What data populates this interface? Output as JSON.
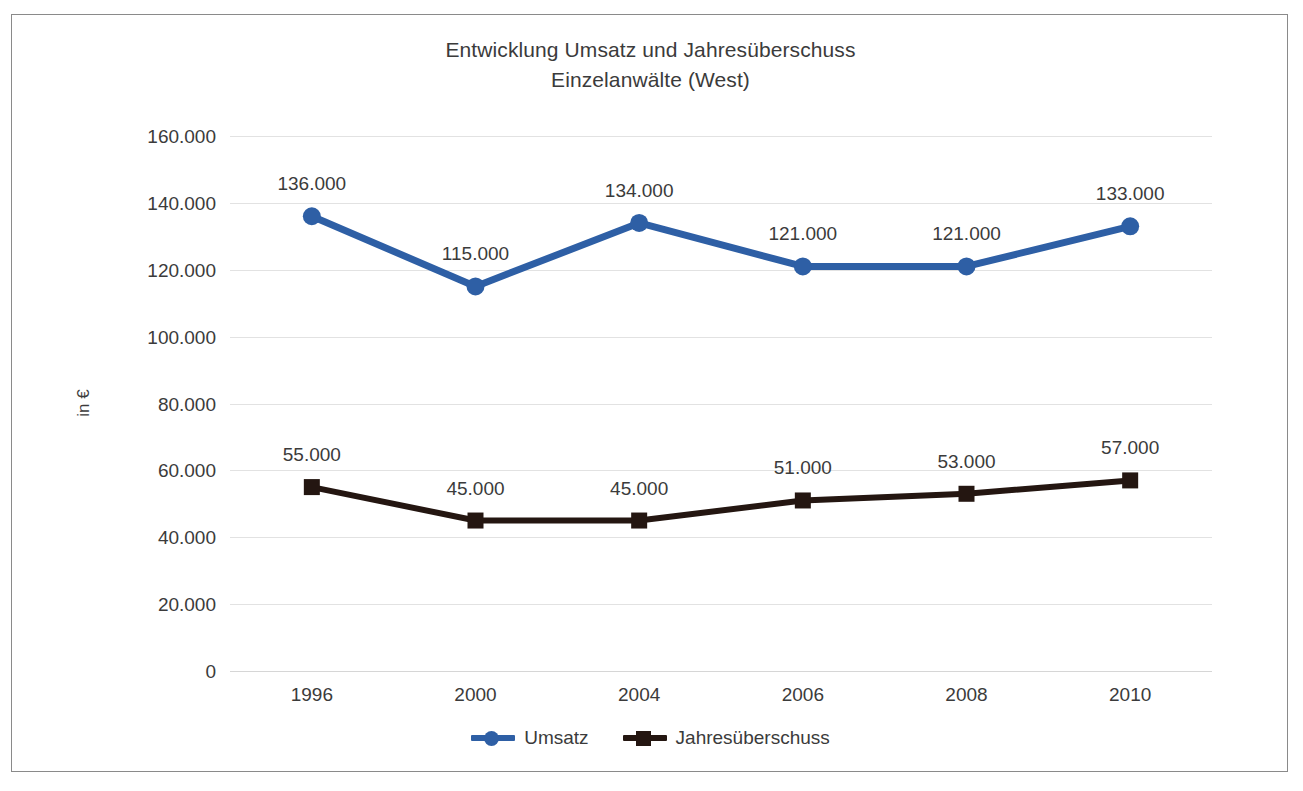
{
  "chart_data": {
    "type": "line",
    "title": "Entwicklung Umsatz und Jahresüberschuss",
    "subtitle": "Einzelanwälte (West)",
    "xlabel": "",
    "ylabel": "in €",
    "categories": [
      "1996",
      "2000",
      "2004",
      "2006",
      "2008",
      "2010"
    ],
    "ylim": [
      0,
      160000
    ],
    "ytick_step": 20000,
    "ytick_labels": [
      "160.000",
      "140.000",
      "120.000",
      "100.000",
      "80.000",
      "60.000",
      "40.000",
      "20.000",
      "0"
    ],
    "ytick_values": [
      160000,
      140000,
      120000,
      100000,
      80000,
      60000,
      40000,
      20000,
      0
    ],
    "grid": true,
    "legend_position": "bottom",
    "series": [
      {
        "name": "Umsatz",
        "color": "#2E5FA5",
        "marker": "circle",
        "values": [
          136000,
          115000,
          134000,
          121000,
          121000,
          133000
        ],
        "data_labels": [
          "136.000",
          "115.000",
          "134.000",
          "121.000",
          "121.000",
          "133.000"
        ]
      },
      {
        "name": "Jahresüberschuss",
        "color": "#241611",
        "marker": "square",
        "values": [
          55000,
          45000,
          45000,
          51000,
          53000,
          57000
        ],
        "data_labels": [
          "55.000",
          "45.000",
          "45.000",
          "51.000",
          "53.000",
          "57.000"
        ]
      }
    ]
  },
  "colors": {
    "umsatz": "#2E5FA5",
    "jahresueberschuss": "#241611",
    "gridline": "#e2e2e2",
    "text": "#3b3b3b",
    "frame": "#8a8a8a"
  }
}
